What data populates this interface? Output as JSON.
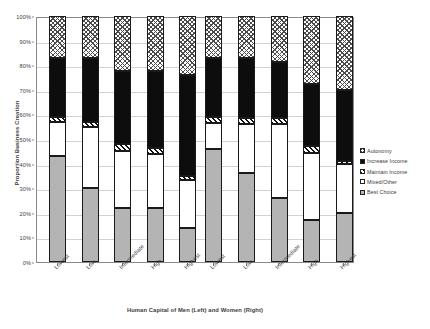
{
  "chart_data": {
    "type": "bar",
    "variant": "stacked-100-percent",
    "title": "",
    "xlabel": "Human Capital of Men (Left) and Women (Right)",
    "ylabel": "Proportion Business Creation",
    "ylim": [
      0,
      100
    ],
    "ytick_labels": [
      "0%",
      "10%",
      "20%",
      "30%",
      "40%",
      "50%",
      "60%",
      "70%",
      "80%",
      "90%",
      "100%"
    ],
    "ytick_values": [
      0,
      10,
      20,
      30,
      40,
      50,
      60,
      70,
      80,
      90,
      100
    ],
    "grid": true,
    "legend_position": "right",
    "groups": [
      {
        "name": "Men",
        "categories": [
          "Lowest",
          "Low",
          "Intermediate",
          "High",
          "Highest"
        ]
      },
      {
        "name": "Women",
        "categories": [
          "Lowest",
          "Low",
          "Intermediate",
          "High",
          "Highest"
        ]
      }
    ],
    "categories": [
      "Lowest",
      "Low",
      "Intermediate",
      "High",
      "Highest",
      "Lowest",
      "Low",
      "Intermediate",
      "High",
      "Highest"
    ],
    "series": [
      {
        "name": "Best Choice",
        "fill": "gray",
        "values": [
          43,
          30,
          22,
          22,
          14,
          46,
          36,
          26,
          17,
          20
        ]
      },
      {
        "name": "Mixed/Other",
        "fill": "white",
        "values": [
          14,
          25,
          23,
          22,
          19.5,
          10.5,
          20,
          30,
          27.5,
          20
        ]
      },
      {
        "name": "Maintain Income",
        "fill": "diagonal-hatch",
        "values": [
          2,
          2,
          3,
          2.5,
          1.5,
          2.5,
          2.5,
          2.5,
          2.5,
          1
        ]
      },
      {
        "name": "Increase Income",
        "fill": "black",
        "values": [
          24,
          26,
          29.5,
          31,
          41,
          24,
          24.5,
          23,
          25.5,
          29
        ]
      },
      {
        "name": "Autonomy",
        "fill": "checker",
        "values": [
          17,
          17,
          22.5,
          22.5,
          24,
          17,
          17,
          18.5,
          27.5,
          30
        ]
      }
    ],
    "cumulative_tops": [
      [
        43,
        57,
        59,
        83,
        100
      ],
      [
        30,
        55,
        57,
        83,
        100
      ],
      [
        22,
        45,
        48,
        77.5,
        100
      ],
      [
        22,
        44,
        46.5,
        77.5,
        100
      ],
      [
        14,
        33.5,
        35,
        76,
        100
      ],
      [
        46,
        56.5,
        59,
        83,
        100
      ],
      [
        36,
        56,
        58.5,
        83,
        100
      ],
      [
        26,
        56,
        58.5,
        81.5,
        100
      ],
      [
        17,
        44.5,
        47,
        72.5,
        100
      ],
      [
        20,
        40,
        41,
        70,
        100
      ]
    ]
  },
  "legend": {
    "items": [
      {
        "label": "Autonomy",
        "fill": "checker"
      },
      {
        "label": "Increase Income",
        "fill": "black"
      },
      {
        "label": "Maintain Income",
        "fill": "diagonal-hatch"
      },
      {
        "label": "Mixed/Other",
        "fill": "white"
      },
      {
        "label": "Best Choice",
        "fill": "gray"
      }
    ]
  },
  "colors": {
    "best_choice": "#b4b4b4",
    "mixed_other": "#ffffff",
    "maintain_income": "#111111",
    "increase_income": "#0d0d0d",
    "autonomy": "#4a4a4a",
    "gridline": "#d2d2d2",
    "axis": "#8a8a8a",
    "text": "#3c3c3c"
  }
}
